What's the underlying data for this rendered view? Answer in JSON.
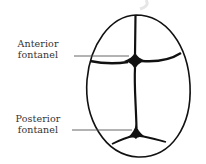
{
  "diagram": {
    "labels": {
      "anterior": {
        "line1": "Anterior",
        "line2": "fontanel"
      },
      "posterior": {
        "line1": "Posterior",
        "line2": "fontanel"
      }
    },
    "colors": {
      "outline": "#111111",
      "leader": "#555555",
      "text": "#333333",
      "watermark": "#e6e6e6",
      "background": "#ffffff"
    }
  }
}
